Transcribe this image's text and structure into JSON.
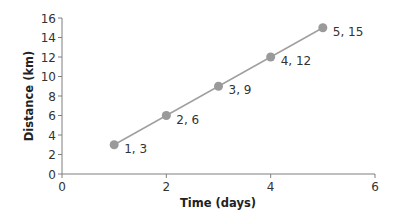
{
  "chart_data": {
    "type": "line",
    "title": "",
    "xlabel": "Time (days)",
    "ylabel": "Distance (km)",
    "xlim": [
      0,
      6
    ],
    "ylim": [
      0,
      16
    ],
    "x_ticks": [
      0,
      2,
      4,
      6
    ],
    "y_ticks": [
      0,
      2,
      4,
      6,
      8,
      10,
      12,
      14,
      16
    ],
    "grid": false,
    "legend": null,
    "series": [
      {
        "name": "Distance",
        "x": [
          1,
          2,
          3,
          4,
          5
        ],
        "y": [
          3,
          6,
          9,
          12,
          15
        ],
        "point_labels": [
          "1, 3",
          "2, 6",
          "3, 9",
          "4, 12",
          "5, 15"
        ],
        "line_color": "#a0a0a0",
        "marker_color": "#9a9a9a"
      }
    ]
  },
  "colors": {
    "axis": "#7f7f7f",
    "line": "#a0a0a0",
    "marker": "#9a9a9a",
    "text": "#333333"
  }
}
